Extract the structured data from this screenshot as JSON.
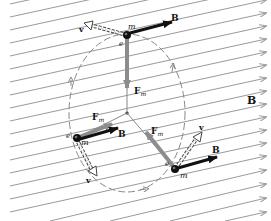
{
  "diagram": {
    "field_label": "B",
    "colors": {
      "field_lines": "#9a9a9a",
      "force_arrow": "#8c8c8c",
      "b_arrow": "#111111",
      "velocity_arrow": "#555555",
      "orbit": "#888888",
      "particle": "#111111"
    },
    "particles": [
      {
        "id": "top",
        "charge_label": "e",
        "mass_label": "m",
        "velocity_label": "v",
        "b_label": "B",
        "force_label": "F",
        "force_subscript": "m"
      },
      {
        "id": "left",
        "charge_label": "e",
        "mass_label": "m",
        "velocity_label": "v",
        "b_label": "B",
        "force_label": "F",
        "force_subscript": "m"
      },
      {
        "id": "right",
        "charge_label": "e",
        "mass_label": "m",
        "velocity_label": "v",
        "b_label": "B",
        "force_label": "F",
        "force_subscript": "m"
      }
    ]
  }
}
